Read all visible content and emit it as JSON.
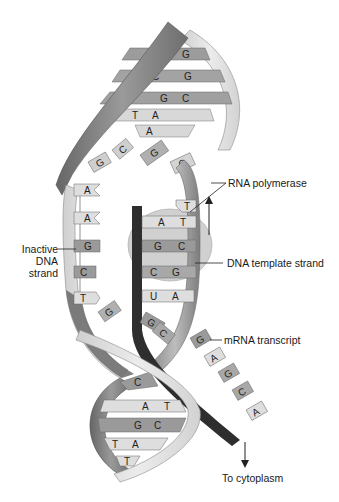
{
  "diagram": {
    "title": "",
    "type": "DNA transcription",
    "labels": {
      "rna_polymerase": "RNA polymerase",
      "dna_template_strand": "DNA template strand",
      "inactive_strand_line1": "Inactive",
      "inactive_strand_line2": "DNA",
      "inactive_strand_line3": "strand",
      "mrna_transcript": "mRNA transcript",
      "to_cytoplasm": "To cytoplasm"
    },
    "upper_helix_pairs": [
      {
        "left": "C",
        "right": "G"
      },
      {
        "left": "C",
        "right": "G"
      },
      {
        "left": "G",
        "right": "C"
      },
      {
        "left": "T",
        "right": "A"
      },
      {
        "left": "A",
        "right": ""
      }
    ],
    "unwound_top_bases": [
      "G",
      "C",
      "G",
      "C"
    ],
    "inactive_strand_bases": [
      "A",
      "A",
      "G",
      "C",
      "T",
      "G"
    ],
    "template_pairs": [
      {
        "template": "T",
        "rna": ""
      },
      {
        "template": "T",
        "rna": "A"
      },
      {
        "template": "C",
        "rna": "G"
      },
      {
        "template": "G",
        "rna": "C"
      },
      {
        "template": "A",
        "rna": "U"
      },
      {
        "template": "",
        "rna": "G"
      },
      {
        "template": "",
        "rna": "C"
      }
    ],
    "mrna_bases": [
      "G",
      "A",
      "G",
      "C",
      "A"
    ],
    "lower_helix_pairs": [
      {
        "left": "C",
        "right": ""
      },
      {
        "left": "A",
        "right": "T"
      },
      {
        "left": "G",
        "right": "C"
      },
      {
        "left": "T",
        "right": "A"
      },
      {
        "left": "",
        "right": "T"
      }
    ],
    "colors": {
      "backbone_dark": "#7a7a7a",
      "backbone_light": "#d6d6d6",
      "base_dark": "#9a9a9a",
      "base_light": "#dedede",
      "rna_strand": "#2e2e2e",
      "polymerase": "#c8c8c8"
    }
  }
}
